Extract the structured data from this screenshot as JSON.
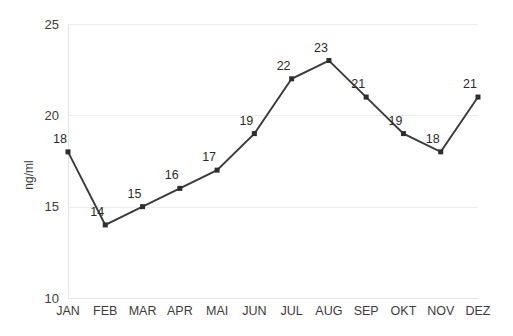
{
  "chart_data": {
    "type": "line",
    "title": "",
    "subtitle": "",
    "xlabel": "",
    "ylabel": "ng/ml",
    "categories": [
      "JAN",
      "FEB",
      "MAR",
      "APR",
      "MAI",
      "JUN",
      "JUL",
      "AUG",
      "SEP",
      "OKT",
      "NOV",
      "DEZ"
    ],
    "values": [
      18,
      14,
      15,
      16,
      17,
      19,
      22,
      23,
      21,
      19,
      18,
      21
    ],
    "point_labels": [
      "18",
      "14",
      "15",
      "16",
      "17",
      "19",
      "22",
      "23",
      "21",
      "19",
      "18",
      "21"
    ],
    "series": [
      {
        "name": "ng/ml",
        "values": [
          18,
          14,
          15,
          16,
          17,
          19,
          22,
          23,
          21,
          19,
          18,
          21
        ]
      }
    ],
    "ylim": [
      10,
      25
    ],
    "yticks": [
      10,
      15,
      20,
      25
    ],
    "ytick_labels": [
      "10",
      "15",
      "20",
      "25"
    ],
    "grid": true,
    "grid_axis": "y",
    "legend": false,
    "legend_position": "none",
    "marker": "square",
    "colors": {
      "line": "#3a3a3a",
      "marker": "#2e2e2e",
      "grid": "#ededed",
      "axis": "#e4e4e4",
      "text": "#3c3c3c",
      "background": "#ffffff"
    },
    "annotations": []
  },
  "layout": {
    "plot_left": 68,
    "plot_right": 478,
    "plot_top": 24,
    "plot_bottom": 298,
    "canvas_width": 513,
    "canvas_height": 336
  }
}
